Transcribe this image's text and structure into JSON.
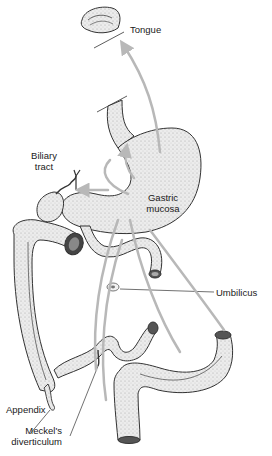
{
  "diagram": {
    "labels": {
      "tongue": "Tongue",
      "biliary_line1": "Biliary",
      "biliary_line2": "tract",
      "gastric_line1": "Gastric",
      "gastric_line2": "mucosa",
      "umbilicus": "Umbilicus",
      "appendix": "Appendix",
      "meckels_line1": "Meckel's",
      "meckels_line2": "diverticulum"
    },
    "organs": [
      "tongue",
      "esophagus",
      "stomach",
      "gallbladder",
      "biliary-tract",
      "duodenum",
      "small-intestine",
      "colon",
      "appendix",
      "meckels-diverticulum",
      "umbilicus",
      "rectum"
    ],
    "colors": {
      "ink": "#1a1a1a",
      "organ_fill": "#e6e6e6",
      "arrow": "#b8b8b8",
      "background": "#ffffff"
    }
  }
}
